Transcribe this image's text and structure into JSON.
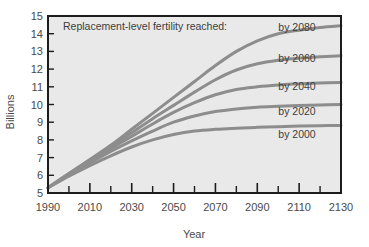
{
  "chart_data": {
    "type": "line",
    "title": "",
    "annotation": "Replacement-level fertility reached:",
    "xlabel": "Year",
    "ylabel": "Billions",
    "xlim": [
      1990,
      2130
    ],
    "ylim": [
      5,
      15
    ],
    "grid": false,
    "legend_position": "inline-right",
    "xticks": [
      1990,
      2010,
      2030,
      2050,
      2070,
      2090,
      2110,
      2130
    ],
    "xticklabels": [
      "1990",
      "2010",
      "2030",
      "2050",
      "2070",
      "2090",
      "2110",
      "2130"
    ],
    "xminorticks": [
      2000,
      2020,
      2040,
      2060,
      2080,
      2100,
      2120
    ],
    "yticks": [
      5,
      6,
      7,
      8,
      9,
      10,
      11,
      12,
      13,
      14,
      15
    ],
    "yticklabels": [
      "5",
      "6",
      "7",
      "8",
      "9",
      "10",
      "11",
      "12",
      "13",
      "14",
      "15"
    ],
    "x": [
      1990,
      2000,
      2010,
      2020,
      2030,
      2040,
      2050,
      2060,
      2070,
      2080,
      2090,
      2100,
      2110,
      2120,
      2130
    ],
    "series": [
      {
        "name": "by 2080",
        "label": "by 2080",
        "color": "#8d8d8d",
        "values": [
          5.3,
          6.1,
          6.9,
          7.7,
          8.6,
          9.5,
          10.4,
          11.3,
          12.2,
          13.0,
          13.6,
          14.0,
          14.2,
          14.35,
          14.45
        ]
      },
      {
        "name": "by 2060",
        "label": "by 2060",
        "color": "#8d8d8d",
        "values": [
          5.3,
          6.1,
          6.85,
          7.6,
          8.4,
          9.2,
          9.95,
          10.7,
          11.4,
          11.95,
          12.3,
          12.5,
          12.62,
          12.7,
          12.75
        ]
      },
      {
        "name": "by 2040",
        "label": "by 2040",
        "color": "#8d8d8d",
        "values": [
          5.3,
          6.05,
          6.8,
          7.5,
          8.2,
          8.9,
          9.55,
          10.1,
          10.55,
          10.85,
          11.0,
          11.1,
          11.17,
          11.22,
          11.25
        ]
      },
      {
        "name": "by 2020",
        "label": "by 2020",
        "color": "#8d8d8d",
        "values": [
          5.3,
          6.0,
          6.7,
          7.35,
          7.95,
          8.5,
          9.0,
          9.35,
          9.6,
          9.75,
          9.85,
          9.9,
          9.94,
          9.97,
          10.0
        ]
      },
      {
        "name": "by 2000",
        "label": "by 2000",
        "color": "#8d8d8d",
        "values": [
          5.3,
          5.95,
          6.55,
          7.1,
          7.6,
          8.0,
          8.3,
          8.5,
          8.6,
          8.66,
          8.71,
          8.75,
          8.78,
          8.8,
          8.82
        ]
      }
    ]
  },
  "style": {
    "plot_background": "#e9e9e9",
    "frame_color": "#1c1c1c",
    "line_color": "#8d8d8d",
    "text_color": "#4a4a4a",
    "page_background": "#ffffff"
  }
}
